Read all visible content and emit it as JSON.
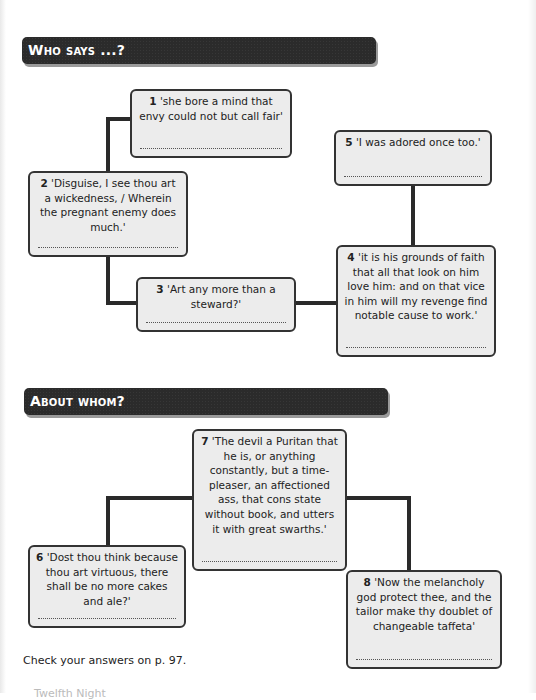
{
  "sections": [
    {
      "title": "Who says ...?",
      "quotes": [
        {
          "number": "1",
          "text": "'she bore a mind that envy could not but call fair'",
          "answer": ""
        },
        {
          "number": "2",
          "text": "'Disguise, I see thou art a wickedness, / Wherein the pregnant enemy does much.'",
          "answer": ""
        },
        {
          "number": "3",
          "text": "'Art any more than a steward?'",
          "answer": ""
        },
        {
          "number": "4",
          "text": "'it is his grounds of faith that all that look on him love him: and on that vice in him will my revenge find notable cause to work.'",
          "answer": ""
        },
        {
          "number": "5",
          "text": "'I was adored once too.'",
          "answer": ""
        }
      ]
    },
    {
      "title": "About whom?",
      "quotes": [
        {
          "number": "6",
          "text": "'Dost thou think because thou art virtuous, there shall be no more cakes and ale?'",
          "answer": ""
        },
        {
          "number": "7",
          "text": "'The devil a Puritan that he is, or anything constantly, but a time-pleaser, an affectioned ass, that cons state without book, and utters it with great swarths.'",
          "answer": ""
        },
        {
          "number": "8",
          "text": "'Now the melancholy god protect thee, and the tailor make thy doublet of changeable taffeta'",
          "answer": ""
        }
      ]
    }
  ],
  "footer": {
    "note": "Check your answers on p. 97.",
    "running_footer": "Twelfth Night"
  },
  "colors": {
    "banner": "#2b2b2b",
    "box_fill": "#ececec",
    "line": "#2a2a2a"
  }
}
